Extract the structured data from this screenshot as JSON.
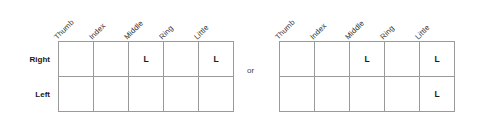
{
  "figure": {
    "separator_label": "or",
    "column_headers": [
      "Thumb",
      "Index",
      "Middle",
      "Ring",
      "Little"
    ],
    "row_labels": [
      "Right",
      "Left"
    ],
    "mark_symbol": "L",
    "colors": {
      "grid_line": "#9a9a9a",
      "text": "#1a1a1a",
      "header_text": "#333333",
      "separator_text": "#444444",
      "background": "#ffffff"
    },
    "tables": [
      {
        "name": "left-option",
        "rows": [
          {
            "label": "Right",
            "cells": [
              "",
              "",
              "L",
              "",
              "L"
            ]
          },
          {
            "label": "Left",
            "cells": [
              "",
              "",
              "",
              "",
              ""
            ]
          }
        ]
      },
      {
        "name": "right-option",
        "rows": [
          {
            "label": "Right",
            "cells": [
              "",
              "",
              "L",
              "",
              "L"
            ]
          },
          {
            "label": "Left",
            "cells": [
              "",
              "",
              "",
              "",
              "L"
            ]
          }
        ]
      }
    ]
  }
}
